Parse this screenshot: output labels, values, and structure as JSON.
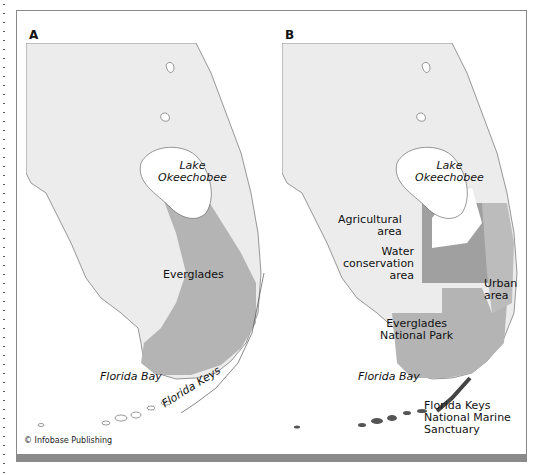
{
  "credit": "© Infobase Publishing",
  "colors": {
    "land": "#ececec",
    "everglades": "#b4b4b4",
    "water_conservation": "#a0a0a0",
    "urban": "#bcbcbc",
    "agricultural": "#ffffff",
    "keys_sanctuary": "#555555",
    "frame": "#888888"
  },
  "panel_a": {
    "label": "A",
    "lake": [
      "Lake",
      "Okeechobee"
    ],
    "everglades": "Everglades",
    "bay": "Florida Bay",
    "keys": "Florida Keys"
  },
  "panel_b": {
    "label": "B",
    "lake": [
      "Lake",
      "Okeechobee"
    ],
    "agricultural": [
      "Agricultural",
      "area"
    ],
    "water": [
      "Water",
      "conservation",
      "area"
    ],
    "urban": [
      "Urban",
      "area"
    ],
    "park": [
      "Everglades",
      "National Park"
    ],
    "bay": "Florida Bay",
    "sanctuary": [
      "Florida Keys",
      "National Marine",
      "Sanctuary"
    ]
  }
}
